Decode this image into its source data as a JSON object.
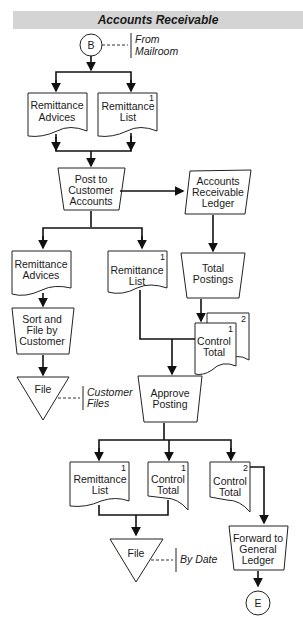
{
  "title": "Accounts Receivable",
  "connectors": {
    "start": "B",
    "end": "E"
  },
  "annotations": {
    "from_mailroom": [
      "From",
      "Mailroom"
    ],
    "customer_files": [
      "Customer",
      "Files"
    ],
    "by_date": "By Date"
  },
  "documents": {
    "remittance_advices_1": [
      "Remittance",
      "Advices"
    ],
    "remittance_list_1": [
      "Remittance",
      "List"
    ],
    "remittance_list_1_num": "1",
    "remittance_advices_2": [
      "Remittance",
      "Advices"
    ],
    "remittance_list_2": [
      "Remittance",
      "List"
    ],
    "remittance_list_2_num": "1",
    "control_total_stack": [
      "Control",
      "Total"
    ],
    "control_total_stack_num1": "1",
    "control_total_stack_num2": "2",
    "remittance_list_3": [
      "Remittance",
      "List"
    ],
    "remittance_list_3_num": "1",
    "control_total_3a": [
      "Control",
      "Total"
    ],
    "control_total_3a_num": "1",
    "control_total_3b": [
      "Control",
      "Total"
    ],
    "control_total_3b_num": "2"
  },
  "processes": {
    "post_to_customer_accounts": [
      "Post to",
      "Customer",
      "Accounts"
    ],
    "accounts_receivable_ledger": [
      "Accounts",
      "Receivable",
      "Ledger"
    ],
    "total_postings": [
      "Total",
      "Postings"
    ],
    "sort_and_file": [
      "Sort and",
      "File by",
      "Customer"
    ],
    "approve_posting": [
      "Approve",
      "Posting"
    ],
    "forward_to_general_ledger": [
      "Forward to",
      "General",
      "Ledger"
    ]
  },
  "files": {
    "file_customer": "File",
    "file_date": "File"
  }
}
